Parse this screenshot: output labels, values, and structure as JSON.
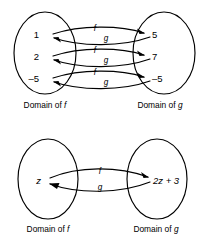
{
  "figure": {
    "background_color": "#ffffff",
    "stroke_color": "#000000"
  },
  "panels": [
    {
      "id": "panel-numeric",
      "left_caption_prefix": "Domain of ",
      "left_caption_var": "f",
      "right_caption_prefix": "Domain of ",
      "right_caption_var": "g",
      "forward_label": "f",
      "reverse_label": "g",
      "rows": [
        {
          "left": "1",
          "right": "5",
          "forward_label": "f",
          "reverse_label": "g"
        },
        {
          "left": "2",
          "right": "7",
          "forward_label": "f",
          "reverse_label": "g"
        },
        {
          "left": "–5",
          "right": "–5",
          "forward_label": "f",
          "reverse_label": "g"
        }
      ]
    },
    {
      "id": "panel-symbolic",
      "left_caption_prefix": "Domain of ",
      "left_caption_var": "f",
      "right_caption_prefix": "Domain of ",
      "right_caption_var": "g",
      "forward_label": "f",
      "reverse_label": "g",
      "rows": [
        {
          "left": "z",
          "right": "2z + 3",
          "forward_label": "f",
          "reverse_label": "g"
        }
      ]
    }
  ],
  "icons": {
    "ellipse": "ellipse-shape",
    "arrow_forward": "arrow-right-icon",
    "arrow_reverse": "arrow-left-icon"
  }
}
